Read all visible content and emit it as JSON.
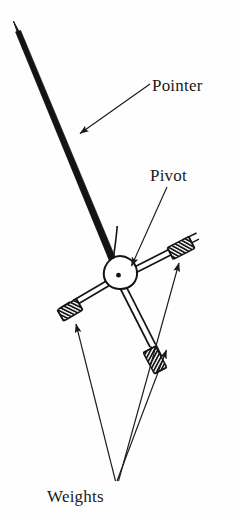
{
  "figure": {
    "kind": "mechanical-diagram",
    "background_color": "#fefefe",
    "ink_color": "#1a1a1a"
  },
  "labels": {
    "pointer": "Pointer",
    "pivot": "Pivot",
    "weights": "Weights"
  },
  "parts": {
    "pointer": {
      "name": "Pointer",
      "description": "long tapered needle with arrow tip at upper left",
      "tip": [
        14,
        22
      ],
      "base": [
        124,
        282
      ]
    },
    "pivot": {
      "name": "Pivot",
      "description": "teardrop hub with center dot",
      "center": [
        118,
        276
      ]
    },
    "arm_right": {
      "name": "right arm",
      "end": [
        190,
        247
      ]
    },
    "arm_left": {
      "name": "left arm",
      "end": [
        63,
        311
      ]
    },
    "arm_lower": {
      "name": "lower arm",
      "end": [
        155,
        357
      ]
    },
    "weights": [
      {
        "name": "weight-right",
        "position": [
          181,
          248
        ]
      },
      {
        "name": "weight-left",
        "position": [
          70,
          310
        ]
      },
      {
        "name": "weight-lower",
        "position": [
          155,
          360
        ]
      }
    ]
  },
  "leaders": {
    "pointer": {
      "from": [
        150,
        84
      ],
      "to": [
        78,
        135
      ]
    },
    "pivot": {
      "from": [
        166,
        186
      ],
      "to": [
        130,
        268
      ]
    },
    "weights_fan_origin": [
      116,
      483
    ],
    "weights_targets": [
      [
        74,
        322
      ],
      [
        168,
        348
      ],
      [
        180,
        262
      ]
    ]
  }
}
